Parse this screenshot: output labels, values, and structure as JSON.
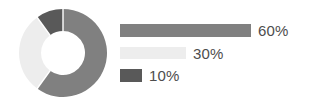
{
  "canvas": {
    "width": 309,
    "height": 108,
    "background": "#ffffff"
  },
  "chart_data": {
    "type": "pie",
    "variant": "donut",
    "title": "",
    "subtitle": "",
    "xlabel": "",
    "ylabel": "",
    "legend_position": "right",
    "grid": false,
    "units": "percent",
    "total": 100,
    "hole_ratio": 0.5,
    "start_angle_deg": 0,
    "direction": "clockwise",
    "categories": [
      "60%",
      "30%",
      "10%"
    ],
    "values": [
      60,
      30,
      10
    ],
    "labels": [
      "60%",
      "30%",
      "10%"
    ],
    "colors": [
      "#808080",
      "#ededed",
      "#595959"
    ],
    "slices": [
      {
        "label": "60%",
        "value": 60,
        "color": "#808080",
        "start_deg": 0,
        "end_deg": 216,
        "legend_bar_width_px": 131
      },
      {
        "label": "30%",
        "value": 30,
        "color": "#ededed",
        "start_deg": 216,
        "end_deg": 324,
        "legend_bar_width_px": 66
      },
      {
        "label": "10%",
        "value": 10,
        "color": "#595959",
        "start_deg": 324,
        "end_deg": 360,
        "legend_bar_width_px": 22
      }
    ]
  },
  "donut": {
    "center_x": 44,
    "center_y": 44,
    "outer_radius": 44,
    "inner_radius": 22,
    "separator_color": "#ffffff",
    "separator_width": 1.4
  },
  "legend": {
    "text_color": "#4d4d4d",
    "rows": [
      {
        "label": "60%",
        "color": "#808080",
        "bar_width": 131
      },
      {
        "label": "30%",
        "color": "#ededed",
        "bar_width": 66
      },
      {
        "label": "10%",
        "color": "#595959",
        "bar_width": 22
      }
    ]
  }
}
